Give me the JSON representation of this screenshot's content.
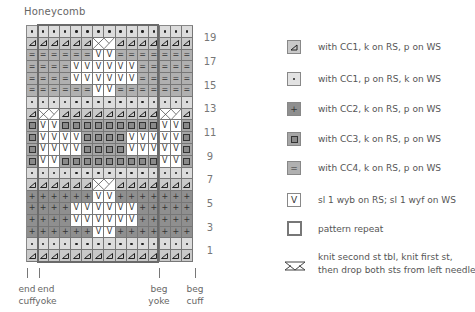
{
  "title": "Honeycomb",
  "chart": {
    "columns": 15,
    "rows": 20,
    "symbols": {
      "T": "knit-CC1",
      "D": "purl-CC1",
      "P": "knit-CC2",
      "S": "knit-CC3",
      "E": "knit-CC4",
      "V": "slip",
      "X": "cross-left",
      "x": "cross-right"
    },
    "grid_top_to_bottom": [
      "DDDDDDDDDDDDDDD",
      "TTTTTTXxTTTTTTT",
      "EEEEEEVVEEEEEEE",
      "EEEEVVVVVVEEEEE",
      "EEEEVVVVVVEEEEE",
      "EEEEEEVVEEEEEEE",
      "DDDDDDDDDDDDDDD",
      "TXxTTTTTTTTTXxT",
      "SVVSSSSSSSSSVVS",
      "SVVVVSSSSVVVVVS",
      "SVVVVSSSSVVVVVS",
      "SVVSSSSSSSSSVVS",
      "DDDDDDDDDDDDDDD",
      "TTTTTTXxTTTTTTT",
      "PPPPPPVVPPPPPPP",
      "PPPPVVVVVVPPPPP",
      "PPPPVVVVVVPPPPP",
      "PPPPPPVVPPPPPPP",
      "DDDDDDDDDDDDDDD",
      "TTTTTTTTTTTTTTT"
    ],
    "row_numbers": [
      "19",
      "17",
      "15",
      "13",
      "11",
      "9",
      "7",
      "5",
      "3",
      "1"
    ],
    "repeat": {
      "start_col": 2,
      "end_col": 12
    }
  },
  "markers": [
    {
      "label_line1": "end",
      "label_line2": "cuff"
    },
    {
      "label_line1": "end",
      "label_line2": "yoke"
    },
    {
      "label_line1": "beg",
      "label_line2": "yoke"
    },
    {
      "label_line1": "beg",
      "label_line2": "cuff"
    }
  ],
  "legend": [
    {
      "symbol": "triangle",
      "text": "with CC1, k on RS, p on WS",
      "color": "#c9c9c9"
    },
    {
      "symbol": "dot",
      "text": "with CC1, p on RS, k on WS",
      "color": "#dcdcdc"
    },
    {
      "symbol": "+",
      "text": "with CC2, k on RS, p on WS",
      "color": "#8f8f8f"
    },
    {
      "symbol": "square",
      "text": "with CC3, k on RS, p on WS",
      "color": "#a6a6a6"
    },
    {
      "symbol": "=",
      "text": "with CC4, k on RS, p on WS",
      "color": "#b0b0b0"
    },
    {
      "symbol": "V",
      "text": "sl 1 wyb on RS; sl 1 wyf on WS",
      "color": "#ffffff"
    },
    {
      "symbol": "repeat-box",
      "text": "pattern repeat"
    },
    {
      "symbol": "cross",
      "text_line1": "knit second st tbl, knit first st,",
      "text_line2": "then drop both sts from left needle"
    }
  ]
}
